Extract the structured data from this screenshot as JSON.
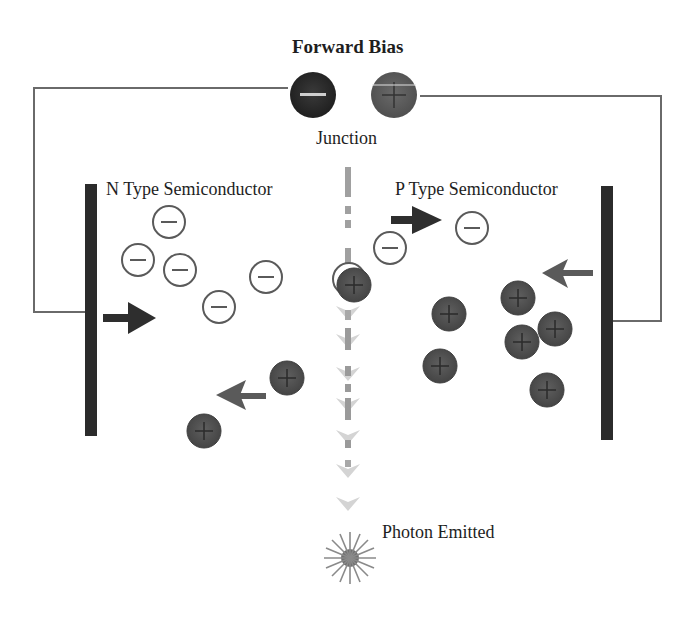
{
  "title": "Forward Bias",
  "labels": {
    "junction": "Junction",
    "n_type": "N Type Semiconductor",
    "p_type": "P Type Semiconductor",
    "photon": "Photon Emitted"
  },
  "battery": {
    "negative_terminal": "−",
    "positive_terminal": "+"
  },
  "colors": {
    "hole": "#555555",
    "battery_negative": "#2a2a2a",
    "battery_positive": "#5e5e5e",
    "plate": "#2b2b2b",
    "wire": "#6a6a6a",
    "arrow_dark": "#2e2e2e",
    "arrow_gray": "#5a5a5a",
    "junction_line": "#9a9a9a"
  },
  "electrons_n_side": [
    {
      "x": 169,
      "y": 222
    },
    {
      "x": 138,
      "y": 260
    },
    {
      "x": 180,
      "y": 270
    },
    {
      "x": 219,
      "y": 307
    },
    {
      "x": 266,
      "y": 277
    }
  ],
  "electrons_p_side": [
    {
      "x": 390,
      "y": 248
    },
    {
      "x": 472,
      "y": 228
    }
  ],
  "holes_p_side": [
    {
      "x": 449,
      "y": 314
    },
    {
      "x": 518,
      "y": 298
    },
    {
      "x": 555,
      "y": 329
    },
    {
      "x": 522,
      "y": 342
    },
    {
      "x": 440,
      "y": 366
    },
    {
      "x": 547,
      "y": 390
    }
  ],
  "holes_n_side": [
    {
      "x": 287,
      "y": 378
    },
    {
      "x": 204,
      "y": 431
    }
  ],
  "junction_pair": {
    "x": 352,
    "y": 284
  }
}
